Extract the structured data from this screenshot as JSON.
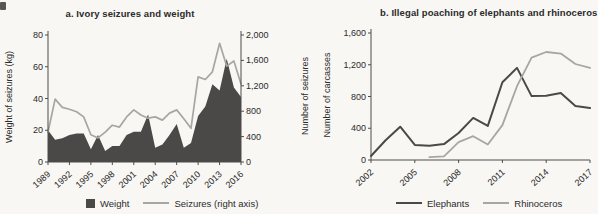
{
  "page": {
    "background": "#f8f7f4"
  },
  "colors": {
    "dark_series": "#4a4947",
    "light_series": "#a7a6a3",
    "axis": "#4d4d4b",
    "text": "#2b2b2a"
  },
  "chart_data": [
    {
      "type": "area+line",
      "panel": "a",
      "title": "a. Ivory seizures and weight",
      "x": [
        1989,
        1990,
        1991,
        1992,
        1993,
        1994,
        1995,
        1996,
        1997,
        1998,
        1999,
        2000,
        2001,
        2002,
        2003,
        2004,
        2005,
        2006,
        2007,
        2008,
        2009,
        2010,
        2011,
        2012,
        2013,
        2014,
        2015,
        2016
      ],
      "x_ticks": [
        1989,
        1992,
        1995,
        1998,
        2001,
        2004,
        2007,
        2010,
        2013,
        2016
      ],
      "left_axis": {
        "label": "Weight of seizures (kg)",
        "range": [
          0,
          80
        ],
        "ticks": [
          0,
          20,
          40,
          60,
          80
        ],
        "tick_labels": [
          "0",
          "20",
          "40",
          "60",
          "80"
        ]
      },
      "right_axis": {
        "label": "Number of seizures",
        "range": [
          0,
          2000
        ],
        "ticks": [
          0,
          400,
          800,
          1200,
          1600,
          2000
        ],
        "tick_labels": [
          "0",
          "400",
          "800",
          "1,200",
          "1,600",
          "2,000"
        ]
      },
      "series": [
        {
          "name": "Weight",
          "type": "area",
          "axis": "left",
          "color": "#4a4947",
          "values": [
            20,
            14,
            15,
            17,
            18,
            18,
            8,
            17,
            7,
            10,
            10,
            17,
            19,
            19,
            30,
            9,
            11,
            17,
            24,
            9,
            12,
            29,
            35,
            49,
            45,
            65,
            47,
            41
          ]
        },
        {
          "name": "Seizures (right axis)",
          "type": "line",
          "axis": "right",
          "color": "#a7a6a3",
          "width": 1.7,
          "values": [
            470,
            990,
            860,
            830,
            790,
            710,
            430,
            380,
            470,
            580,
            550,
            710,
            820,
            740,
            690,
            710,
            660,
            770,
            820,
            680,
            530,
            1340,
            1300,
            1420,
            1870,
            1510,
            1590,
            1230
          ]
        }
      ],
      "legend": {
        "position": "bottom",
        "entries": [
          "Weight",
          "Seizures (right axis)"
        ]
      },
      "grid": false
    },
    {
      "type": "line",
      "panel": "b",
      "title": "b. Illegal poaching of elephants and rhinoceros",
      "x": [
        2002,
        2003,
        2004,
        2005,
        2006,
        2007,
        2008,
        2009,
        2010,
        2011,
        2012,
        2013,
        2014,
        2015,
        2016,
        2017
      ],
      "x_ticks": [
        2002,
        2005,
        2008,
        2011,
        2014,
        2017
      ],
      "left_axis": {
        "label": "Number of carcasses",
        "range": [
          0,
          1600
        ],
        "ticks": [
          0,
          400,
          800,
          1200,
          1600
        ],
        "tick_labels": [
          "0",
          "400",
          "800",
          "1,200",
          "1,600"
        ]
      },
      "series": [
        {
          "name": "Elephants",
          "type": "line",
          "axis": "left",
          "color": "#4a4947",
          "width": 2,
          "values": [
            50,
            250,
            420,
            190,
            180,
            200,
            340,
            530,
            430,
            980,
            1160,
            805,
            810,
            845,
            680,
            655
          ]
        },
        {
          "name": "Rhinoceros",
          "type": "line",
          "axis": "left",
          "color": "#a7a6a3",
          "width": 1.8,
          "values": [
            null,
            null,
            null,
            null,
            35,
            45,
            225,
            300,
            195,
            440,
            930,
            1290,
            1360,
            1340,
            1210,
            1160
          ]
        }
      ],
      "legend": {
        "position": "bottom",
        "entries": [
          "Elephants",
          "Rhinoceros"
        ]
      },
      "grid": false
    }
  ]
}
